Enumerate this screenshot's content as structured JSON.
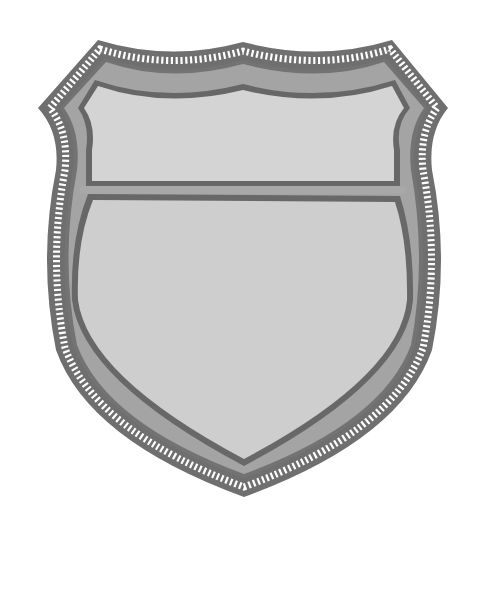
{
  "image": {
    "subject": "blank shield badge illustration",
    "background": "#ffffff"
  },
  "shield": {
    "colors": {
      "outer_rim": "#6f6f6f",
      "beading": "#ffffff",
      "band": "#a3a3a3",
      "inner_outline": "#6a6a6a",
      "top_panel": "#d3d3d3",
      "main_panel": "#cdcdcd",
      "divider_band": "#a8a8a8"
    },
    "panels": [
      "top-banner-panel",
      "main-body-panel"
    ]
  }
}
